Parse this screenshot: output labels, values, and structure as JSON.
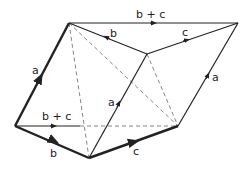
{
  "diagram": {
    "labels": {
      "a_left": "a",
      "a_middle": "a",
      "a_right": "a",
      "b_top": "b",
      "b_bottom": "b",
      "c_top": "c",
      "c_bottom": "c",
      "bc_top": "b + c",
      "bc_bottom": "b + c"
    },
    "colors": {
      "line": "#222222",
      "dashed": "#777777"
    }
  }
}
